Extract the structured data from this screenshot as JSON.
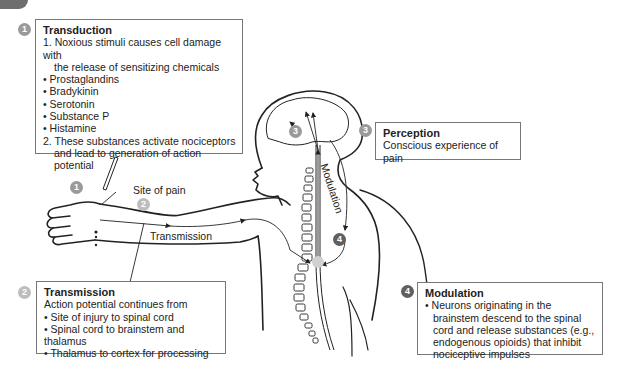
{
  "steps": {
    "transduction": {
      "number": "1",
      "title": "Transduction",
      "line1a": "1. Noxious stimuli causes cell damage with",
      "line1b": "the release of sensitizing chemicals",
      "chemicals": [
        "• Prostaglandins",
        "• Bradykinin",
        "• Serotonin",
        "• Substance P",
        "• Histamine"
      ],
      "line2a": "2. These substances activate nociceptors",
      "line2b": "and lead to generation of action potential"
    },
    "transmission": {
      "number": "2",
      "title": "Transmission",
      "intro": "Action potential continues from",
      "items": [
        "• Site of injury to spinal cord",
        "• Spinal cord to brainstem and thalamus",
        "• Thalamus to cortex for processing"
      ]
    },
    "perception": {
      "number": "3",
      "title": "Perception",
      "text": "Conscious experience of pain"
    },
    "modulation": {
      "number": "4",
      "title": "Modulation",
      "text": "• Neurons originating in the brainstem descend to the spinal cord and release substances (e.g., endogenous opioids) that inhibit nociceptive impulses"
    }
  },
  "figure_labels": {
    "site_of_pain": "Site of pain",
    "transmission": "Transmission",
    "modulation": "Modulation",
    "arm_badge_1": "1",
    "arm_badge_2": "2",
    "brain_badge_3": "3",
    "spine_badge_4": "4",
    "spine_badge_2": "2"
  },
  "colors": {
    "badge_1": "#9a9a9a",
    "badge_2": "#bdbdbd",
    "badge_3": "#9a9a9a",
    "badge_4": "#5f5f5f"
  }
}
